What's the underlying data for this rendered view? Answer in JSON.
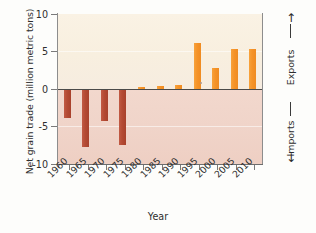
{
  "chart_data": {
    "type": "bar",
    "title": "",
    "xlabel": "Year",
    "ylabel": "Net grain trade (million metric tons)",
    "categories": [
      "1960",
      "1965",
      "1970",
      "1975",
      "1980",
      "1985",
      "1990",
      "1995",
      "2000",
      "2005",
      "2010"
    ],
    "values": [
      -3.9,
      -7.7,
      -4.3,
      -7.4,
      0.3,
      0.4,
      0.6,
      6.2,
      2.8,
      5.3,
      5.3
    ],
    "ylim": [
      -10,
      10
    ],
    "yticks": [
      "10",
      "5",
      "0",
      "-5",
      "-10"
    ],
    "ytick_values": [
      10,
      5,
      0,
      -5,
      -10
    ],
    "grid": false,
    "legend": "none",
    "annotations": {
      "upper_region": "Exports",
      "lower_region": "Imports",
      "up_arrow": "↑",
      "down_arrow": "↓"
    },
    "colors": {
      "positive_bar": "#f59328",
      "negative_bar": "#b44a33",
      "upper_band": "#f8efdf",
      "lower_band": "#f0d4c9",
      "zero_line": "#4a4a4a",
      "axis": "#8d8d8d",
      "text": "#2e2e2e"
    }
  }
}
